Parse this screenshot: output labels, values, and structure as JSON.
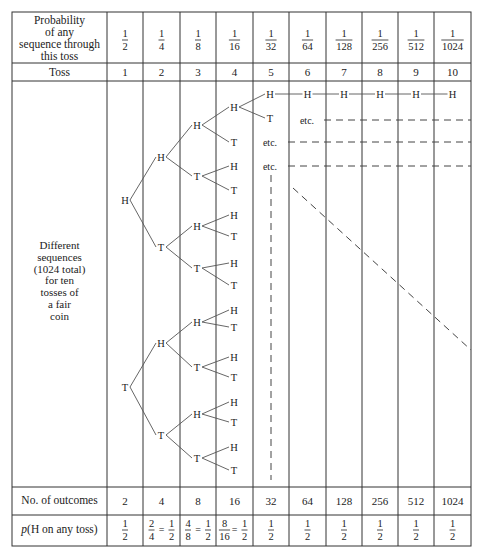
{
  "header_row": {
    "label": "Probability of any sequence through this toss",
    "label_lines": [
      "Probability",
      "of any",
      "sequence through",
      "this toss"
    ],
    "values": [
      {
        "num": "1",
        "den": "2"
      },
      {
        "num": "1",
        "den": "4"
      },
      {
        "num": "1",
        "den": "8"
      },
      {
        "num": "1",
        "den": "16"
      },
      {
        "num": "1",
        "den": "32"
      },
      {
        "num": "1",
        "den": "64"
      },
      {
        "num": "1",
        "den": "128"
      },
      {
        "num": "1",
        "den": "256"
      },
      {
        "num": "1",
        "den": "512"
      },
      {
        "num": "1",
        "den": "1024"
      }
    ]
  },
  "toss_row": {
    "label": "Toss",
    "values": [
      "1",
      "2",
      "3",
      "4",
      "5",
      "6",
      "7",
      "8",
      "9",
      "10"
    ]
  },
  "tree_row": {
    "label_lines": [
      "Different",
      "sequences",
      "(1024 total)",
      "for ten",
      "tosses of",
      "a fair",
      "coin"
    ],
    "etc_label": "etc.",
    "heads": "H",
    "tails": "T"
  },
  "outcomes_row": {
    "label": "No. of outcomes",
    "values": [
      "2",
      "4",
      "8",
      "16",
      "32",
      "64",
      "128",
      "256",
      "512",
      "1024"
    ]
  },
  "p_row": {
    "label_italic": "p",
    "label_rest": "(H on any toss)",
    "values": [
      {
        "parts": [
          {
            "num": "1",
            "den": "2"
          }
        ]
      },
      {
        "parts": [
          {
            "num": "2",
            "den": "4"
          },
          {
            "num": "1",
            "den": "2"
          }
        ]
      },
      {
        "parts": [
          {
            "num": "4",
            "den": "8"
          },
          {
            "num": "1",
            "den": "2"
          }
        ]
      },
      {
        "parts": [
          {
            "num": "8",
            "den": "16"
          },
          {
            "num": "1",
            "den": "2"
          }
        ]
      },
      {
        "parts": [
          {
            "num": "1",
            "den": "2"
          }
        ]
      },
      {
        "parts": [
          {
            "num": "1",
            "den": "2"
          }
        ]
      },
      {
        "parts": [
          {
            "num": "1",
            "den": "2"
          }
        ]
      },
      {
        "parts": [
          {
            "num": "1",
            "den": "2"
          }
        ]
      },
      {
        "parts": [
          {
            "num": "1",
            "den": "2"
          }
        ]
      },
      {
        "parts": [
          {
            "num": "1",
            "den": "2"
          }
        ]
      }
    ],
    "equals": "="
  },
  "colors": {
    "line": "#333333",
    "tree_line": "#555555",
    "text": "#222222",
    "background": "#ffffff"
  }
}
